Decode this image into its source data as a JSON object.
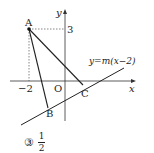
{
  "diagram": {
    "axes": {
      "x_label": "x",
      "y_label": "y",
      "origin_label": "O"
    },
    "ticks": {
      "x_tick": "−2",
      "y_tick": "3"
    },
    "points": [
      {
        "name": "A",
        "coords": [
          -2,
          3
        ]
      },
      {
        "name": "B",
        "label": "B"
      },
      {
        "name": "C",
        "label": "C"
      }
    ],
    "labels": {
      "A": "A",
      "B": "B",
      "C": "C"
    },
    "line_equation": "y=m(x−2)",
    "colors": {
      "stroke": "#222222",
      "background": "#ffffff"
    }
  },
  "answer": {
    "marker": "③",
    "numerator": "1",
    "denominator": "2"
  }
}
